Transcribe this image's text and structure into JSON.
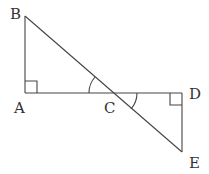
{
  "diagram": {
    "type": "geometry",
    "points": {
      "A": {
        "label": "A",
        "x": 25,
        "y": 93
      },
      "B": {
        "label": "B",
        "x": 25,
        "y": 16
      },
      "C": {
        "label": "C",
        "x": 113,
        "y": 93
      },
      "D": {
        "label": "D",
        "x": 182,
        "y": 93
      },
      "E": {
        "label": "E",
        "x": 182,
        "y": 152
      }
    },
    "segments": [
      "AB",
      "AD",
      "BE",
      "DE"
    ],
    "right_angles": [
      "A",
      "D"
    ],
    "marked_angles": [
      "ACB",
      "DCE"
    ],
    "stroke_color": "#444444",
    "label_color": "#333333"
  }
}
